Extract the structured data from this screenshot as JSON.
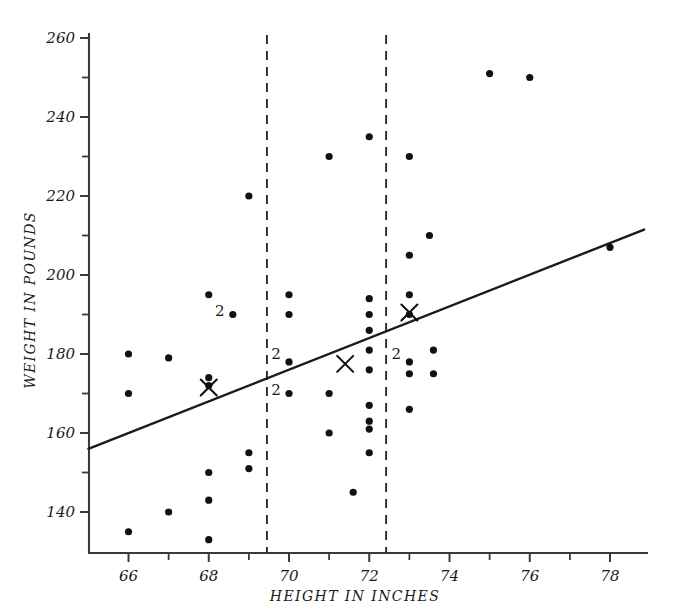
{
  "chart_data": {
    "type": "scatter",
    "title": "",
    "xlabel": "HEIGHT IN INCHES",
    "ylabel": "WEIGHT IN POUNDS",
    "xlim": [
      65.0,
      78.8
    ],
    "ylim": [
      133.0,
      262.0
    ],
    "xticks_major": [
      66,
      68,
      70,
      72,
      74,
      76,
      78
    ],
    "xticks_minor": [
      65,
      67,
      69,
      71,
      73,
      75,
      77
    ],
    "xtick_labels": [
      "66",
      "68",
      "70",
      "72",
      "74",
      "76",
      "78"
    ],
    "yticks_major": [
      140,
      160,
      180,
      200,
      220,
      240,
      260
    ],
    "yticks_minor": [
      150,
      170,
      190,
      210,
      230,
      250
    ],
    "ytick_labels": [
      "140",
      "160",
      "180",
      "200",
      "220",
      "240",
      "260"
    ],
    "grid": false,
    "legend": null,
    "points": [
      {
        "x": 66.0,
        "y": 180,
        "n": 1
      },
      {
        "x": 66.0,
        "y": 170,
        "n": 1
      },
      {
        "x": 66.0,
        "y": 135,
        "n": 1
      },
      {
        "x": 67.0,
        "y": 179,
        "n": 1
      },
      {
        "x": 67.0,
        "y": 140,
        "n": 1
      },
      {
        "x": 68.0,
        "y": 195,
        "n": 1
      },
      {
        "x": 68.0,
        "y": 174,
        "n": 1
      },
      {
        "x": 68.0,
        "y": 172,
        "n": 1
      },
      {
        "x": 68.0,
        "y": 150,
        "n": 1
      },
      {
        "x": 68.0,
        "y": 143,
        "n": 1
      },
      {
        "x": 68.0,
        "y": 133,
        "n": 1
      },
      {
        "x": 68.6,
        "y": 190,
        "n": 2
      },
      {
        "x": 69.0,
        "y": 220,
        "n": 1
      },
      {
        "x": 69.0,
        "y": 155,
        "n": 1
      },
      {
        "x": 69.0,
        "y": 151,
        "n": 1
      },
      {
        "x": 70.0,
        "y": 195,
        "n": 1
      },
      {
        "x": 70.0,
        "y": 190,
        "n": 1
      },
      {
        "x": 70.0,
        "y": 178,
        "n": 2
      },
      {
        "x": 70.0,
        "y": 170,
        "n": 2
      },
      {
        "x": 71.0,
        "y": 230,
        "n": 1
      },
      {
        "x": 71.0,
        "y": 170,
        "n": 1
      },
      {
        "x": 71.0,
        "y": 160,
        "n": 1
      },
      {
        "x": 72.0,
        "y": 235,
        "n": 1
      },
      {
        "x": 72.0,
        "y": 194,
        "n": 1
      },
      {
        "x": 72.0,
        "y": 190,
        "n": 1
      },
      {
        "x": 72.0,
        "y": 186,
        "n": 1
      },
      {
        "x": 72.0,
        "y": 181,
        "n": 1
      },
      {
        "x": 72.0,
        "y": 176,
        "n": 1
      },
      {
        "x": 72.0,
        "y": 167,
        "n": 1
      },
      {
        "x": 72.0,
        "y": 163,
        "n": 1
      },
      {
        "x": 72.0,
        "y": 161,
        "n": 1
      },
      {
        "x": 72.0,
        "y": 155,
        "n": 1
      },
      {
        "x": 71.6,
        "y": 145,
        "n": 1
      },
      {
        "x": 73.0,
        "y": 230,
        "n": 1
      },
      {
        "x": 73.0,
        "y": 205,
        "n": 1
      },
      {
        "x": 73.0,
        "y": 195,
        "n": 1
      },
      {
        "x": 73.0,
        "y": 190,
        "n": 1
      },
      {
        "x": 73.0,
        "y": 178,
        "n": 2
      },
      {
        "x": 73.0,
        "y": 175,
        "n": 1
      },
      {
        "x": 73.0,
        "y": 166,
        "n": 1
      },
      {
        "x": 73.5,
        "y": 210,
        "n": 1
      },
      {
        "x": 73.6,
        "y": 181,
        "n": 1
      },
      {
        "x": 73.6,
        "y": 175,
        "n": 1
      },
      {
        "x": 75.0,
        "y": 251,
        "n": 1
      },
      {
        "x": 76.0,
        "y": 250,
        "n": 1
      },
      {
        "x": 78.0,
        "y": 207,
        "n": 1
      }
    ],
    "count_labels": [
      {
        "x": 68.6,
        "y": 191,
        "text": "2"
      },
      {
        "x": 70.0,
        "y": 180,
        "text": "2"
      },
      {
        "x": 70.0,
        "y": 171,
        "text": "2"
      },
      {
        "x": 73.0,
        "y": 180,
        "text": "2"
      }
    ],
    "x_markers": [
      {
        "x": 68.0,
        "y": 171.5,
        "label": "group-mean-left"
      },
      {
        "x": 71.4,
        "y": 177.5,
        "label": "group-mean-middle"
      },
      {
        "x": 73.0,
        "y": 190.5,
        "label": "group-mean-right"
      }
    ],
    "vertical_dashed_lines": [
      {
        "x": 69.45,
        "label": "group-divider-left"
      },
      {
        "x": 72.42,
        "label": "group-divider-right"
      }
    ],
    "regression_line": {
      "x0": 65.0,
      "y0": 156.0,
      "x1": 78.85,
      "y1": 211.5,
      "slope_per_inch": 4.0,
      "label": "regression-line"
    }
  }
}
